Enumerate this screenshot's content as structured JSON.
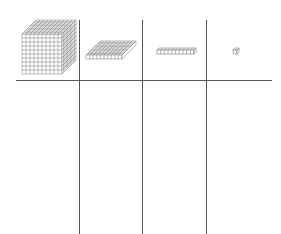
{
  "diagram": {
    "title": "",
    "type": "place-value-chart",
    "columns": [
      {
        "id": "thousands",
        "block": "large-cube",
        "grid": "10x10x10",
        "label": ""
      },
      {
        "id": "hundreds",
        "block": "flat",
        "grid": "10x10",
        "label": ""
      },
      {
        "id": "tens",
        "block": "rod",
        "grid": "10x1",
        "label": ""
      },
      {
        "id": "ones",
        "block": "unit-cube",
        "grid": "1x1",
        "label": ""
      }
    ],
    "colors": {
      "line": "#555555",
      "block_stroke": "#777777",
      "background": "#ffffff"
    }
  }
}
